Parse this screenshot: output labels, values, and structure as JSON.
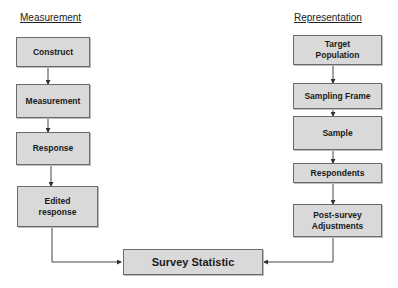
{
  "diagram": {
    "columns": {
      "measurement": {
        "heading": "Measurement",
        "nodes": [
          {
            "id": "construct",
            "label": "Construct"
          },
          {
            "id": "measurement",
            "label": "Measurement"
          },
          {
            "id": "response",
            "label": "Response"
          },
          {
            "id": "edited-response",
            "label": "Edited\nresponse"
          }
        ]
      },
      "representation": {
        "heading": "Representation",
        "nodes": [
          {
            "id": "target-population",
            "label": "Target\nPopulation"
          },
          {
            "id": "sampling-frame",
            "label": "Sampling Frame"
          },
          {
            "id": "sample",
            "label": "Sample"
          },
          {
            "id": "respondents",
            "label": "Respondents"
          },
          {
            "id": "post-survey-adjustments",
            "label": "Post-survey\nAdjustments"
          }
        ]
      }
    },
    "output_node": {
      "id": "survey-statistic",
      "label": "Survey Statistic"
    },
    "edges": [
      [
        "construct",
        "measurement"
      ],
      [
        "measurement",
        "response"
      ],
      [
        "response",
        "edited-response"
      ],
      [
        "edited-response",
        "survey-statistic"
      ],
      [
        "target-population",
        "sampling-frame"
      ],
      [
        "sampling-frame",
        "sample"
      ],
      [
        "sample",
        "respondents"
      ],
      [
        "respondents",
        "post-survey-adjustments"
      ],
      [
        "post-survey-adjustments",
        "survey-statistic"
      ]
    ],
    "colors": {
      "box_fill": "#d9d9d9",
      "box_border": "#6a6a6a",
      "line": "#444444"
    }
  }
}
